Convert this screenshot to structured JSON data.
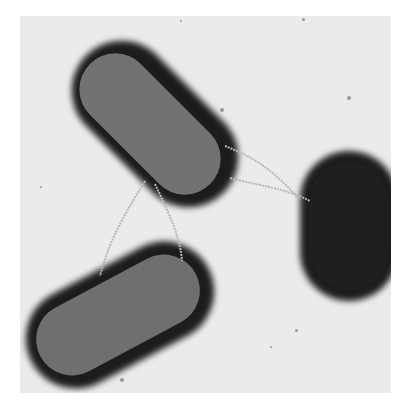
{
  "image": {
    "subject": "Electron micrograph of three rod-shaped bacteria connected by filaments",
    "background_color": "#ffffff",
    "plate_color": "#ecebea",
    "cells": [
      {
        "name": "upper-left bacterium",
        "cx": 145,
        "cy": 111,
        "length": 170,
        "width": 78,
        "angle": 45,
        "fill": "#707070"
      },
      {
        "name": "lower-left bacterium",
        "cx": 118,
        "cy": 315,
        "length": 175,
        "width": 78,
        "angle": -28,
        "fill": "#6e6e6e"
      },
      {
        "name": "right bacterium",
        "cx": 340,
        "cy": 226,
        "length": 128,
        "width": 80,
        "angle": 90,
        "fill": "#1f1f1f"
      }
    ]
  }
}
